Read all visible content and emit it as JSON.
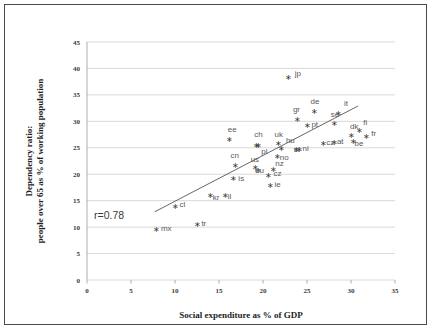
{
  "chart_data": {
    "type": "scatter",
    "title": "",
    "xlabel": "Social expenditure as % of GDP",
    "ylabel_line1": "Dependency ratio:",
    "ylabel_line2": "people over 65 as % of working population",
    "xlim": [
      0,
      35
    ],
    "ylim": [
      0,
      45
    ],
    "xticks": [
      0,
      5,
      10,
      15,
      20,
      25,
      30,
      35
    ],
    "yticks": [
      0,
      5,
      10,
      15,
      20,
      25,
      30,
      35,
      40,
      45
    ],
    "grid": "horizontal",
    "legend": "none",
    "annotation": "r=0.78",
    "correlation": 0.78,
    "trendline": {
      "x_start": 7.7,
      "y_start": 12.9,
      "x_end": 30.8,
      "y_end": 32.9
    },
    "marker_style": "asterisk",
    "marker_color": "#7b7b7b",
    "points": [
      {
        "label": "mx",
        "x": 7.9,
        "y": 9.6
      },
      {
        "label": "tr",
        "x": 12.5,
        "y": 10.4
      },
      {
        "label": "cl",
        "x": 10.0,
        "y": 13.9
      },
      {
        "label": "kr",
        "x": 14.0,
        "y": 15.9
      },
      {
        "label": "il",
        "x": 15.7,
        "y": 16.0
      },
      {
        "label": "is",
        "x": 16.7,
        "y": 19.2
      },
      {
        "label": "cn",
        "x": 16.9,
        "y": 21.6
      },
      {
        "label": "ee",
        "x": 16.2,
        "y": 26.5
      },
      {
        "label": "us",
        "x": 19.2,
        "y": 21.3
      },
      {
        "label": "eu",
        "x": 19.5,
        "y": 20.6
      },
      {
        "label": "pl",
        "x": 19.5,
        "y": 25.4
      },
      {
        "label": "ch",
        "x": 19.3,
        "y": 25.4
      },
      {
        "label": "ie",
        "x": 20.9,
        "y": 17.8
      },
      {
        "label": "cz",
        "x": 20.6,
        "y": 19.8
      },
      {
        "label": "nz",
        "x": 21.2,
        "y": 20.9
      },
      {
        "label": "no",
        "x": 21.7,
        "y": 23.4
      },
      {
        "label": "uk",
        "x": 21.8,
        "y": 25.7
      },
      {
        "label": "hu",
        "x": 22.1,
        "y": 24.8
      },
      {
        "label": "jp",
        "x": 22.9,
        "y": 38.3
      },
      {
        "label": "si",
        "x": 23.8,
        "y": 24.7
      },
      {
        "label": "nl",
        "x": 24.2,
        "y": 24.6
      },
      {
        "label": "gr",
        "x": 23.9,
        "y": 30.3
      },
      {
        "label": "pt",
        "x": 25.0,
        "y": 29.1
      },
      {
        "label": "de",
        "x": 25.8,
        "y": 31.8
      },
      {
        "label": "cz2",
        "x": 26.9,
        "y": 25.8
      },
      {
        "label": "at",
        "x": 28.1,
        "y": 25.9
      },
      {
        "label": "se",
        "x": 28.1,
        "y": 29.5
      },
      {
        "label": "it",
        "x": 28.6,
        "y": 31.5
      },
      {
        "label": "be",
        "x": 30.3,
        "y": 26.2
      },
      {
        "label": "dk",
        "x": 30.1,
        "y": 27.3
      },
      {
        "label": "fi",
        "x": 31.0,
        "y": 28.3
      },
      {
        "label": "fr",
        "x": 31.8,
        "y": 27.1
      }
    ],
    "point_labels": [
      {
        "text": "mx",
        "x": 8.4,
        "y": 9.2
      },
      {
        "text": "tr",
        "x": 13.0,
        "y": 10.2
      },
      {
        "text": "cl",
        "x": 10.5,
        "y": 13.8
      },
      {
        "text": "kr",
        "x": 14.3,
        "y": 15.1
      },
      {
        "text": "il",
        "x": 16.0,
        "y": 15.3
      },
      {
        "text": "is",
        "x": 17.2,
        "y": 18.7
      },
      {
        "text": "cn",
        "x": 16.3,
        "y": 23.0
      },
      {
        "text": "ee",
        "x": 16.0,
        "y": 27.9
      },
      {
        "text": "us",
        "x": 18.6,
        "y": 22.4
      },
      {
        "text": "eu",
        "x": 19.1,
        "y": 20.2
      },
      {
        "text": "pl",
        "x": 19.8,
        "y": 23.9
      },
      {
        "text": "ch",
        "x": 19.0,
        "y": 27.1
      },
      {
        "text": "ie",
        "x": 21.3,
        "y": 17.5
      },
      {
        "text": "cz",
        "x": 21.2,
        "y": 19.6
      },
      {
        "text": "nz",
        "x": 21.4,
        "y": 21.6
      },
      {
        "text": "no",
        "x": 21.9,
        "y": 22.6
      },
      {
        "text": "uk",
        "x": 21.3,
        "y": 27.1
      },
      {
        "text": "hu",
        "x": 22.6,
        "y": 25.9
      },
      {
        "text": "jp",
        "x": 23.6,
        "y": 38.6
      },
      {
        "text": "si",
        "x": 23.5,
        "y": 24.2
      },
      {
        "text": "nl",
        "x": 24.5,
        "y": 24.3
      },
      {
        "text": "gr",
        "x": 23.4,
        "y": 31.7
      },
      {
        "text": "pt",
        "x": 25.5,
        "y": 28.9
      },
      {
        "text": "de",
        "x": 25.4,
        "y": 33.2
      },
      {
        "text": "cz",
        "x": 27.2,
        "y": 25.5
      },
      {
        "text": "at",
        "x": 28.4,
        "y": 25.8
      },
      {
        "text": "se",
        "x": 27.7,
        "y": 30.8
      },
      {
        "text": "it",
        "x": 29.2,
        "y": 32.9
      },
      {
        "text": "be",
        "x": 30.4,
        "y": 25.3
      },
      {
        "text": "dk",
        "x": 29.9,
        "y": 28.5
      },
      {
        "text": "fi",
        "x": 31.4,
        "y": 29.4
      },
      {
        "text": "fr",
        "x": 32.3,
        "y": 27.2
      }
    ]
  },
  "axes": {
    "x_title": "Social expenditure as % of GDP",
    "y_title_line1": "Dependency ratio:",
    "y_title_line2": "people over 65 as % of working population",
    "x_tick_labels": [
      "0",
      "5",
      "10",
      "15",
      "20",
      "25",
      "30",
      "35"
    ],
    "y_tick_labels": [
      "0",
      "5",
      "10",
      "15",
      "20",
      "25",
      "30",
      "35",
      "40",
      "45"
    ]
  },
  "annotations": {
    "correlation_text": "r=0.78"
  }
}
